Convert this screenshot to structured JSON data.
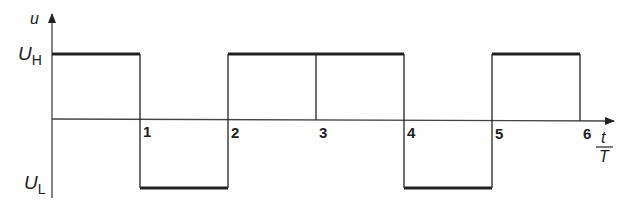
{
  "diagram": {
    "type": "square_wave",
    "y_axis_label": "u",
    "x_axis_label_numerator": "t",
    "x_axis_label_denominator": "T",
    "level_high_label": {
      "main": "U",
      "sub": "H"
    },
    "level_low_label": {
      "main": "U",
      "sub": "L"
    },
    "x_ticks": [
      "1",
      "2",
      "3",
      "4",
      "5",
      "6"
    ],
    "segments": [
      {
        "from": 0,
        "to": 1,
        "level": "high"
      },
      {
        "from": 1,
        "to": 2,
        "level": "low"
      },
      {
        "from": 2,
        "to": 4,
        "level": "high"
      },
      {
        "from": 4,
        "to": 5,
        "level": "low"
      },
      {
        "from": 5,
        "to": 6,
        "level": "high"
      }
    ],
    "line_color": "#222222"
  }
}
